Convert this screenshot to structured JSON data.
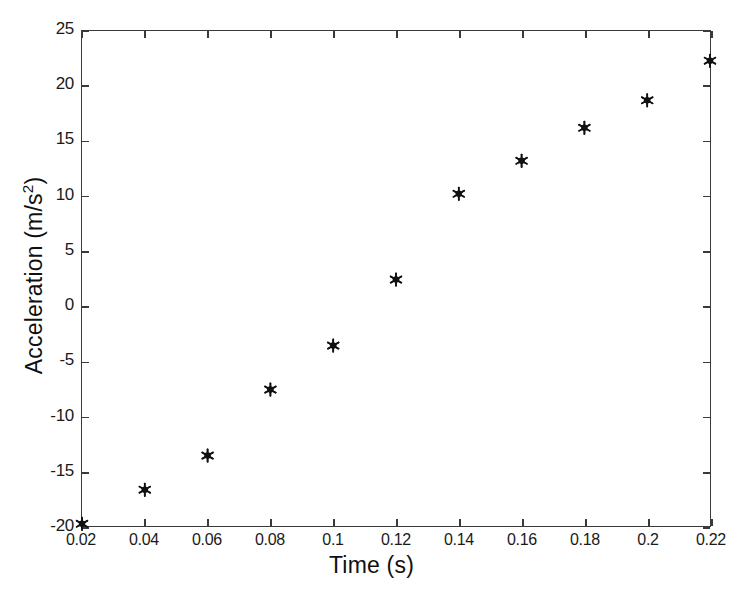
{
  "chart_data": {
    "type": "scatter",
    "title": "",
    "xlabel": "Time (s)",
    "ylabel": "Acceleration (m/s2)",
    "ylabel_base": "Acceleration (m/s",
    "ylabel_exponent": "2",
    "ylabel_close": ")",
    "xlim": [
      0.02,
      0.22
    ],
    "ylim": [
      -20,
      25
    ],
    "grid": false,
    "legend": null,
    "marker": "asterisk-star",
    "marker_color": "#111111",
    "axis_color": "#3a3a3a",
    "background": "#ffffff",
    "x": [
      0.02,
      0.04,
      0.06,
      0.08,
      0.1,
      0.12,
      0.14,
      0.16,
      0.18,
      0.2,
      0.22
    ],
    "values": [
      -19.8,
      -16.7,
      -13.6,
      -7.6,
      -3.6,
      2.4,
      10.2,
      13.2,
      16.2,
      18.7,
      22.3
    ],
    "xticks": [
      0.02,
      0.04,
      0.06,
      0.08,
      0.1,
      0.12,
      0.14,
      0.16,
      0.18,
      0.2,
      0.22
    ],
    "xticklabels": [
      "0.02",
      "0.04",
      "0.06",
      "0.08",
      "0.1",
      "0.12",
      "0.14",
      "0.16",
      "0.18",
      "0.2",
      "0.22"
    ],
    "yticks": [
      -20,
      -15,
      -10,
      -5,
      0,
      5,
      10,
      15,
      20,
      25
    ],
    "yticklabels": [
      "-20",
      "-15",
      "-10",
      "-5",
      "0",
      "5",
      "10",
      "15",
      "20",
      "25"
    ]
  }
}
